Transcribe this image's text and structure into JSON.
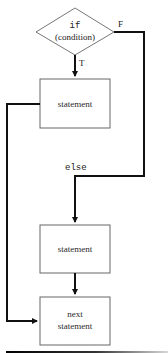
{
  "diagram": {
    "type": "flowchart",
    "decision": {
      "keyword": "if",
      "condition": "(condition)"
    },
    "branches": {
      "true_label": "T",
      "false_label": "F",
      "else_label": "else"
    },
    "nodes": [
      {
        "id": "stmt-true",
        "label": "statement"
      },
      {
        "id": "stmt-else",
        "label": "statement"
      },
      {
        "id": "next",
        "line1": "next",
        "line2": "statement"
      }
    ],
    "colors": {
      "line": "#111111",
      "box_border": "#555555",
      "background": "#ffffff"
    }
  }
}
